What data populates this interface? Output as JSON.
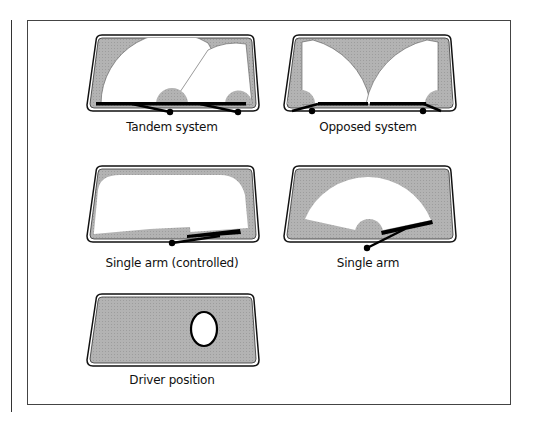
{
  "figure": {
    "colors": {
      "glass_shade": "#b5b5b5",
      "wiped_area": "#ffffff",
      "outline": "#111111",
      "wiper_arm": "#000000"
    },
    "panels": [
      {
        "id": "tandem",
        "label": "Tandem system"
      },
      {
        "id": "opposed",
        "label": "Opposed system"
      },
      {
        "id": "single-arm-controlled",
        "label": "Single arm (controlled)"
      },
      {
        "id": "single-arm",
        "label": "Single arm"
      },
      {
        "id": "driver-position",
        "label": "Driver position"
      }
    ]
  }
}
